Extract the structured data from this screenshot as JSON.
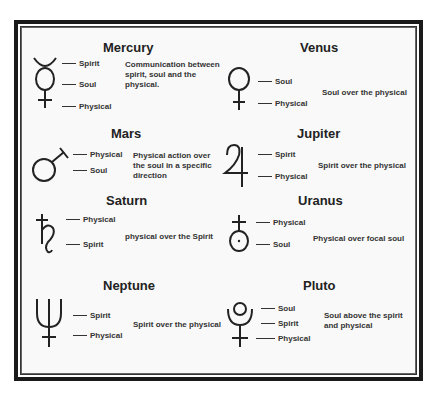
{
  "planets": [
    {
      "name": "Mercury",
      "labels": [
        "Spirit",
        "Soul",
        "Physical"
      ],
      "description": "Communication between spirit, soul and the physical."
    },
    {
      "name": "Venus",
      "labels": [
        "Soul",
        "Physical"
      ],
      "description": "Soul over the physical"
    },
    {
      "name": "Mars",
      "labels": [
        "Physical",
        "Soul"
      ],
      "description": "Physical action over the soul in a specific direction"
    },
    {
      "name": "Jupiter",
      "labels": [
        "Spirit",
        "Physical"
      ],
      "description": "Spirit over the physical"
    },
    {
      "name": "Saturn",
      "labels": [
        "Physical",
        "Spirit"
      ],
      "description": "physical over the Spirit"
    },
    {
      "name": "Uranus",
      "labels": [
        "Physical",
        "Soul"
      ],
      "description": "Physical over focal soul"
    },
    {
      "name": "Neptune",
      "labels": [
        "Spirit",
        "Physical"
      ],
      "description": "Spirit over the physical"
    },
    {
      "name": "Pluto",
      "labels": [
        "Soul",
        "Spirit",
        "Physical"
      ],
      "description": "Soul above the spirit and physical"
    }
  ]
}
